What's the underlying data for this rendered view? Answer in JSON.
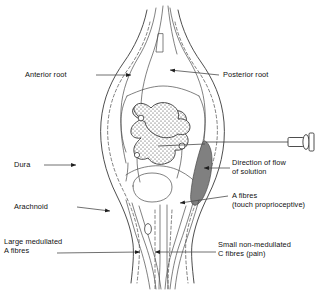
{
  "figure": {
    "background_color": "#ffffff",
    "line_color": "#3a3a3a",
    "bolus_color": "#808080",
    "stipple_color": "#2f2f2f"
  },
  "labels": {
    "anterior_root": "Anterior root",
    "posterior_root": "Posterior root",
    "dura": "Dura",
    "arachnoid": "Arachnoid",
    "large_medullated_line1": "Large medullated",
    "large_medullated_line2": "A fibres",
    "direction_line1": "Direction of flow",
    "direction_line2": "of solution",
    "a_fibres_line1": "A fibres",
    "a_fibres_line2": "(touch proprioceptive)",
    "small_c_line1": "Small non-medullated",
    "small_c_line2": "C fibres (pain)"
  },
  "structures": {
    "dura_mater": "dura-mater-outline",
    "arachnoid_mater": "arachnoid-mater-dashed-outline",
    "gray_matter": "butterfly-gray-matter-stippled",
    "injected_solution": "injected-solution-bolus",
    "needle": "hypodermic-needle",
    "nerve_fibres": "descending-nerve-fibre-bundle",
    "neuron_cell_bodies": "neuron-cell-body-circles"
  }
}
